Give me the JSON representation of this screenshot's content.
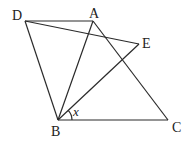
{
  "figure": {
    "points": {
      "D": {
        "label": "D",
        "x": 25,
        "y": 21
      },
      "A": {
        "label": "A",
        "x": 93,
        "y": 21
      },
      "E": {
        "label": "E",
        "x": 139,
        "y": 44
      },
      "B": {
        "label": "B",
        "x": 58,
        "y": 120
      },
      "C": {
        "label": "C",
        "x": 168,
        "y": 120
      }
    },
    "segments": [
      "DA",
      "DB",
      "DE",
      "AB",
      "AC",
      "BE",
      "BC"
    ],
    "angle_label": "x",
    "angle_description": "angle EBC at vertex B"
  }
}
